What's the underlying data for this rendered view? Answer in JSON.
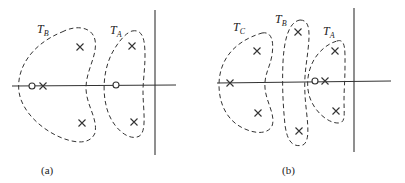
{
  "panels": [
    {
      "id": "a",
      "caption": "(a)",
      "regions": [
        {
          "label": "T",
          "sub": "B"
        },
        {
          "label": "T",
          "sub": "A"
        }
      ],
      "poles": [
        [
          80,
          47
        ],
        [
          82,
          123
        ],
        [
          43,
          86
        ],
        [
          132,
          46
        ],
        [
          134,
          122
        ]
      ],
      "zeros": [
        [
          32,
          86
        ],
        [
          116,
          85
        ]
      ]
    },
    {
      "id": "b",
      "caption": "(b)",
      "regions": [
        {
          "label": "T",
          "sub": "C"
        },
        {
          "label": "T",
          "sub": "B"
        },
        {
          "label": "T",
          "sub": "A"
        }
      ],
      "poles": [
        [
          257,
          51
        ],
        [
          258,
          113
        ],
        [
          230,
          83
        ],
        [
          298,
          32
        ],
        [
          299,
          131
        ],
        [
          335,
          51
        ],
        [
          336,
          111
        ],
        [
          325,
          81
        ]
      ],
      "zeros": [
        [
          315,
          81
        ]
      ]
    }
  ],
  "colors": {
    "ink": "#333333",
    "background": "#ffffff"
  }
}
